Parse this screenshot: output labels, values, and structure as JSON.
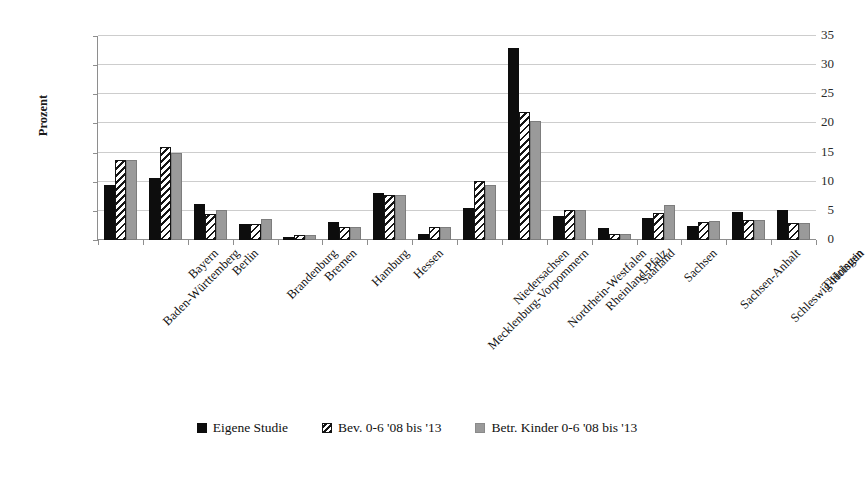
{
  "figure": {
    "title_sliver": "",
    "background": "#ffffff"
  },
  "chart_data": {
    "type": "bar",
    "title": "",
    "xlabel": "",
    "ylabel": "Prozent",
    "ylim": [
      0,
      35
    ],
    "yticks": [
      0,
      5,
      10,
      15,
      20,
      25,
      30,
      35
    ],
    "grid": true,
    "legend_position": "bottom",
    "categories": [
      "Baden-Württemberg",
      "Bayern",
      "Berlin",
      "Brandenburg",
      "Bremen",
      "Hamburg",
      "Hessen",
      "Mecklenburg-Vorpommern",
      "Niedersachsen",
      "Nordrhein-Westfalen",
      "Rheinland-Pfalz",
      "Saarland",
      "Sachsen",
      "Sachsen-Anhalt",
      "Schleswig-Holstein",
      "Thüringen"
    ],
    "series": [
      {
        "name": "Eigene Studie",
        "color": "#0d0d0d",
        "fill": "solid-black",
        "values": [
          9.5,
          10.7,
          6.1,
          2.8,
          0.5,
          3.1,
          8.0,
          1.1,
          5.5,
          33.0,
          4.2,
          2.0,
          3.8,
          2.4,
          4.8,
          5.2
        ]
      },
      {
        "name": "Bev. 0-6 '08 bis '13",
        "color": "#141414",
        "fill": "diagonal-hatch",
        "values": [
          13.8,
          16.0,
          4.4,
          2.8,
          0.8,
          2.3,
          7.8,
          2.2,
          10.1,
          22.0,
          5.2,
          1.0,
          4.7,
          3.1,
          3.4,
          3.0
        ]
      },
      {
        "name": "Betr. Kinder 0-6 '08 bis '13",
        "color": "#9a9a9a",
        "fill": "solid-gray",
        "values": [
          13.8,
          15.0,
          5.2,
          3.6,
          0.8,
          2.3,
          7.7,
          2.2,
          9.4,
          20.5,
          5.2,
          1.0,
          6.0,
          3.2,
          3.4,
          3.0
        ]
      }
    ]
  }
}
